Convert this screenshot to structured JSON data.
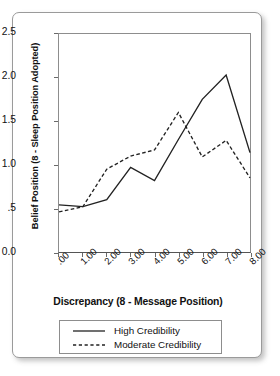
{
  "chart_data": {
    "type": "line",
    "title": "",
    "xlabel": "Discrepancy (8 - Message Position)",
    "ylabel": "Belief Position (8 - Sleep Position Adopted)",
    "x": [
      0,
      1,
      2,
      3,
      4,
      5,
      6,
      7,
      8
    ],
    "categories": [
      ".00",
      "1.00",
      "2.00",
      "3.00",
      "4.00",
      "5.00",
      "6.00",
      "7.00",
      "8.00"
    ],
    "xtick_labels": [
      ".00",
      "1.00",
      "2.00",
      "3.00",
      "4.00",
      "5.00",
      "6.00",
      "7.00",
      "8.00"
    ],
    "ytick_labels": [
      "0.0",
      ".5",
      "1.0",
      "1.5",
      "2.0",
      "2.5"
    ],
    "ytick_values": [
      0.0,
      0.5,
      1.0,
      1.5,
      2.0,
      2.5
    ],
    "xlim": [
      0,
      8
    ],
    "ylim": [
      0.0,
      2.5
    ],
    "grid": false,
    "legend_position": "below-axes",
    "series": [
      {
        "name": "High Credibility",
        "style": "solid",
        "color": "#222222",
        "values": [
          0.54,
          0.52,
          0.6,
          0.97,
          0.82,
          1.29,
          1.75,
          2.03,
          1.14
        ]
      },
      {
        "name": "Moderate Credibility",
        "style": "dashed",
        "color": "#222222",
        "values": [
          0.46,
          0.52,
          0.95,
          1.1,
          1.17,
          1.6,
          1.09,
          1.28,
          0.85
        ]
      }
    ]
  },
  "legend": {
    "entries": [
      {
        "label": "High Credibility"
      },
      {
        "label": "Moderate Credibility"
      }
    ]
  }
}
